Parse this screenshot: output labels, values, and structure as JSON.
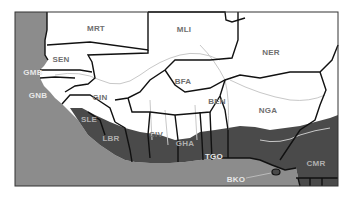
{
  "map": {
    "region": "West Africa",
    "colors": {
      "ocean": "#8c8c8c",
      "land": "#ffffff",
      "forest_zone": "#4a4a4a",
      "border": "#111111",
      "river": "#c8c8c8",
      "frame": "#333333"
    },
    "countries": [
      {
        "code": "MRT",
        "x": 96,
        "y": 28,
        "tone": "dark"
      },
      {
        "code": "MLI",
        "x": 184,
        "y": 29,
        "tone": "dark"
      },
      {
        "code": "NER",
        "x": 271,
        "y": 52,
        "tone": "dark"
      },
      {
        "code": "SEN",
        "x": 61,
        "y": 59,
        "tone": "dark"
      },
      {
        "code": "GMB",
        "x": 33,
        "y": 72,
        "tone": "light"
      },
      {
        "code": "GNB",
        "x": 38,
        "y": 95,
        "tone": "light"
      },
      {
        "code": "GIN",
        "x": 100,
        "y": 97,
        "tone": "dark"
      },
      {
        "code": "BFA",
        "x": 183,
        "y": 81,
        "tone": "dark"
      },
      {
        "code": "BEN",
        "x": 217,
        "y": 101,
        "tone": "dark"
      },
      {
        "code": "NGA",
        "x": 268,
        "y": 110,
        "tone": "dark"
      },
      {
        "code": "SLE",
        "x": 89,
        "y": 119,
        "tone": "mid"
      },
      {
        "code": "LBR",
        "x": 111,
        "y": 138,
        "tone": "mid"
      },
      {
        "code": "CIV",
        "x": 156,
        "y": 134,
        "tone": "dark"
      },
      {
        "code": "GHA",
        "x": 185,
        "y": 143,
        "tone": "mid"
      },
      {
        "code": "TGO",
        "x": 214,
        "y": 156,
        "tone": "light"
      },
      {
        "code": "BKO",
        "x": 236,
        "y": 179,
        "tone": "light"
      },
      {
        "code": "CMR",
        "x": 316,
        "y": 163,
        "tone": "mid"
      }
    ]
  }
}
